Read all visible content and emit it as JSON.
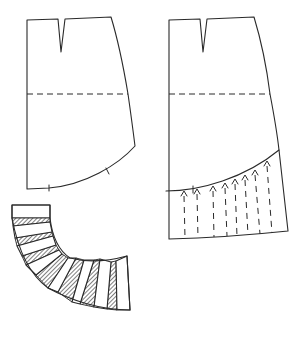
{
  "diagram": {
    "type": "sewing-pattern",
    "colors": {
      "line": "#2a2a2a",
      "background": "#ffffff",
      "hatch": "#2a2a2a"
    },
    "pieces": [
      {
        "id": "skirt-base-left",
        "description": "Basic skirt pattern with waist dart, dashed hip line and curved style line with two notches",
        "features": [
          "waist-dart",
          "hip-line-dashed",
          "curved-hem-style-line",
          "notch-marks-2"
        ]
      },
      {
        "id": "skirt-slashed-right",
        "description": "Same skirt pattern; lower section below curved line marked with vertical dashed slash lines and spread arrows",
        "features": [
          "waist-dart",
          "hip-line-dashed",
          "curved-yoke-line",
          "slash-lines-dashed-9",
          "spread-arrows-9"
        ]
      },
      {
        "id": "flounce-spread",
        "description": "Lower flounce piece slashed and spread into a curved arc; hatched wedges show added fullness",
        "features": [
          "curved-band",
          "hatched-spread-wedges-7"
        ]
      }
    ],
    "labels": []
  }
}
